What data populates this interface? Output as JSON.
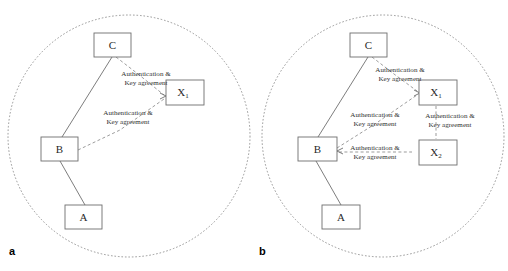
{
  "figure": {
    "background": "#ffffff",
    "width": 508,
    "height": 271,
    "colors": {
      "boundary_stroke": "#8c8c8c",
      "node_stroke": "#6e6e6e",
      "solid_link": "#6e6e6e",
      "dashed_link": "#8a8a8a",
      "text": "#2a2a2a",
      "panel_letter": "#000000"
    }
  },
  "panels": [
    {
      "letter": "a",
      "boundary_name": "network-boundary-circle-a",
      "nodes": [
        {
          "id": "C",
          "label": "C",
          "sub": "",
          "inside": true
        },
        {
          "id": "B",
          "label": "B",
          "sub": "",
          "inside": true
        },
        {
          "id": "A",
          "label": "A",
          "sub": "",
          "inside": true
        },
        {
          "id": "X1",
          "label": "X",
          "sub": "1",
          "inside": true
        }
      ],
      "links": [
        {
          "from": "C",
          "to": "B",
          "style": "solid",
          "label_line1": "",
          "label_line2": ""
        },
        {
          "from": "B",
          "to": "A",
          "style": "solid",
          "label_line1": "",
          "label_line2": ""
        },
        {
          "from": "C",
          "to": "X1",
          "style": "dashed",
          "label_line1": "Authentication &",
          "label_line2": "Key agreement"
        },
        {
          "from": "B",
          "to": "X1",
          "style": "dashed",
          "label_line1": "Authentication &",
          "label_line2": "Key agreement"
        }
      ]
    },
    {
      "letter": "b",
      "boundary_name": "network-boundary-circle-b",
      "nodes": [
        {
          "id": "C",
          "label": "C",
          "sub": "",
          "inside": true
        },
        {
          "id": "B",
          "label": "B",
          "sub": "",
          "inside": true
        },
        {
          "id": "A",
          "label": "A",
          "sub": "",
          "inside": true
        },
        {
          "id": "X1",
          "label": "X",
          "sub": "1",
          "inside": true
        },
        {
          "id": "X2",
          "label": "X",
          "sub": "2",
          "inside": true
        }
      ],
      "links": [
        {
          "from": "C",
          "to": "B",
          "style": "solid",
          "label_line1": "",
          "label_line2": ""
        },
        {
          "from": "B",
          "to": "A",
          "style": "solid",
          "label_line1": "",
          "label_line2": ""
        },
        {
          "from": "C",
          "to": "X1",
          "style": "dashed",
          "label_line1": "Authentication &",
          "label_line2": "Key agreement"
        },
        {
          "from": "B",
          "to": "X1",
          "style": "dashed",
          "label_line1": "Authentication &",
          "label_line2": "Key agreement"
        },
        {
          "from": "X1",
          "to": "X2",
          "style": "dashed",
          "label_line1": "Authentication &",
          "label_line2": "Key agreement"
        },
        {
          "from": "B",
          "to": "X2",
          "style": "dashed",
          "label_line1": "Authentication &",
          "label_line2": "Key agreement"
        }
      ]
    }
  ],
  "labels": {
    "a_letter": "a",
    "b_letter": "b",
    "auth_line1": "Authentication &",
    "auth_line2": "Key agreement",
    "node_a": "A",
    "node_b": "B",
    "node_c": "C",
    "node_x": "X",
    "sub_1": "1",
    "sub_2": "2"
  }
}
